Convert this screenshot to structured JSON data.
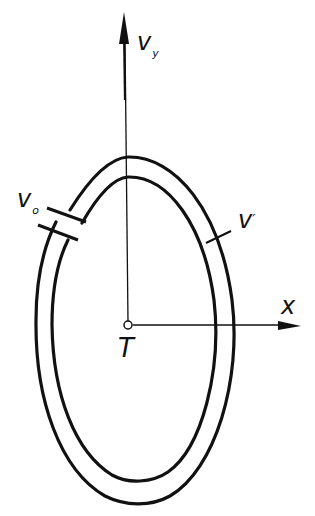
{
  "diagram": {
    "type": "conveyor loop with coordinate axes",
    "colors": {
      "stroke": "#111111",
      "background": "#ffffff"
    },
    "labels": {
      "vy_main": "v",
      "vy_sub": "y",
      "v0_main": "v",
      "v0_sub": "o",
      "vprime_main": "v",
      "vprime_mark": "′",
      "x_axis": "x",
      "origin": "T"
    },
    "axes": {
      "vertical": {
        "name": "v_y",
        "direction": "up"
      },
      "horizontal": {
        "name": "x",
        "direction": "right"
      },
      "origin": "T"
    },
    "elements": [
      {
        "id": "outer-ring",
        "description": "outer boundary of closed elliptical loop"
      },
      {
        "id": "inner-ring",
        "description": "inner boundary of closed elliptical loop"
      },
      {
        "id": "gap-marker",
        "description": "break in loop at upper-left labeled v_o"
      },
      {
        "id": "tick-marker",
        "description": "tick across loop on right side labeled v′"
      }
    ]
  }
}
